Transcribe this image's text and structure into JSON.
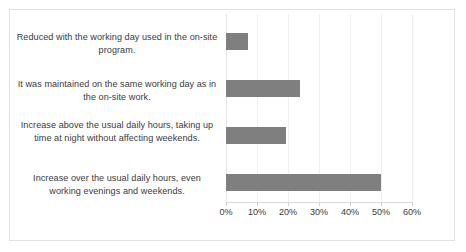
{
  "chart_data": {
    "type": "bar",
    "orientation": "horizontal",
    "title": "",
    "xlabel": "",
    "ylabel": "",
    "xlim": [
      0,
      60
    ],
    "xtick_labels": [
      "0%",
      "10%",
      "20%",
      "30%",
      "40%",
      "50%",
      "60%"
    ],
    "xticks": [
      0,
      10,
      20,
      30,
      40,
      50,
      60
    ],
    "grid": true,
    "legend": false,
    "bar_color": "#7f7f7f",
    "categories": [
      "Reduced with the working day used in the on-site program.",
      "It was maintained on the same working day as in the on-site work.",
      "Increase above the usual daily hours, taking up time at night without affecting weekends.",
      "Increase over the usual daily hours, even working evenings and weekends."
    ],
    "values": [
      7,
      24,
      19.5,
      50
    ],
    "value_labels": [
      "7%",
      "24%",
      "19.5%",
      "50%"
    ]
  }
}
